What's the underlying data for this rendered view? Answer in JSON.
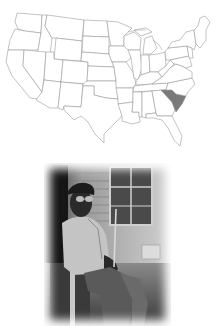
{
  "map": {
    "subject": "United States map",
    "highlighted_state": "South Carolina",
    "highlight_color": "#7a7a7a",
    "border_color": "#9a9a9a",
    "fill_color": "#ffffff"
  },
  "photo": {
    "subject": "Elderly man in cap and glasses seated on a porch",
    "style": "black-and-white vignette",
    "tones": {
      "dark": "#1a1a1a",
      "mid": "#6e6e6e",
      "light": "#d8d8d8"
    }
  }
}
